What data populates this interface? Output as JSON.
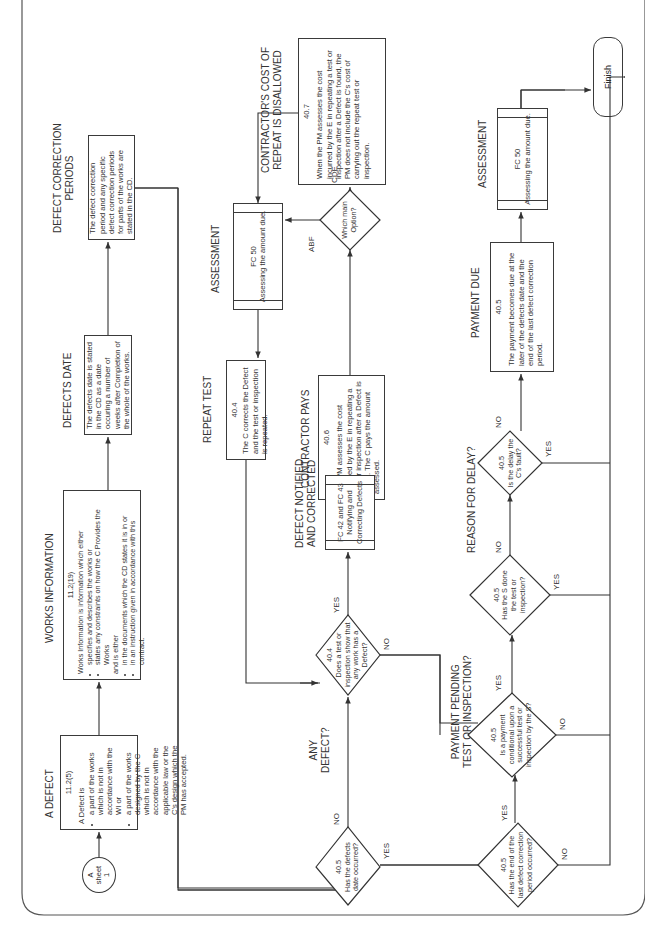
{
  "orientation": "rotated 90 degrees counterclockwise",
  "connector": {
    "label": "A",
    "sub": "sheet",
    "num": "1"
  },
  "headings": {
    "a_defect": "A DEFECT",
    "works_information": "WORKS INFORMATION",
    "defects_date": "DEFECTS DATE",
    "defect_correction_periods_1": "DEFECT CORRECTION",
    "defect_correction_periods_2": "PERIODS",
    "repeat_test": "REPEAT TEST",
    "assessment_1": "ASSESSMENT",
    "contractors_cost_1": "CONTRACTOR'S COST OF",
    "contractors_cost_2": "REPEAT IS DISALLOWED",
    "contractor_pays": "CONTRACTOR PAYS",
    "defect_notified_1": "DEFECT NOTIFIED",
    "defect_notified_2": "AND CORRECTED",
    "any_defect_1": "ANY",
    "any_defect_2": "DEFECT?",
    "payment_pending_1": "PAYMENT PENDING",
    "payment_pending_2": "TEST OR INSPECTION?",
    "reason_for_delay": "REASON FOR DELAY?",
    "payment_due": "PAYMENT DUE",
    "assessment_2": "ASSESSMENT"
  },
  "boxes": {
    "a_defect": {
      "ref": "11.2(5)",
      "intro": "A Defect is",
      "bullets": [
        "a part of the works which is not in accordance with the WI or",
        "a part of the works designed by the C which is not in accordance with the applicable law or the C's design which the PM has accepted."
      ]
    },
    "works_information": {
      "ref": "11.2(19)",
      "intro": "Works Information is information which either",
      "bullets1": [
        "specifies and describes the works or",
        "states any constraints on how the C Provides the Works"
      ],
      "mid": "and is either",
      "bullets2": [
        "in the documents which the CD states it is in or",
        "in an instruction given in accordance with this contract."
      ]
    },
    "defects_date": "The defects date is stated in the CD as a date occuring a number of weeks after Completion of the whole of the works.",
    "defect_correction_periods": "The defect correction period and any specific defect correction periods for parts of the works are stated in the CD.",
    "repeat_test": {
      "ref": "40.4",
      "text": "The C corrects the Defect and the test or inspection is repeated."
    },
    "contractors_cost": {
      "ref": "40.7",
      "text": "When the PM assesses the cost incurred by the E in repeating a test or inspection after a Defect is found, the PM does not include the C's cost of carrying out the repeat test or inspection."
    },
    "contractor_pays": {
      "ref": "40.6",
      "text": "The PM assesses the cost incurred by the E in repeating a test or inspection after a Defect is found. The C pays the amount assessed."
    },
    "payment_due": {
      "ref": "40.5",
      "text": "The payment becomes due at the later of the defects date and the end of the last defect correction period."
    }
  },
  "processes": {
    "fc50_a": {
      "code": "FC 50",
      "text": "Assessing the amount due."
    },
    "fc42_43": {
      "code": "FC 42 and FC 43",
      "text": "Notifying and Correcting Defects"
    },
    "fc50_b": {
      "code": "FC 50",
      "text": "Assessing the amount due."
    }
  },
  "decisions": {
    "main_option": {
      "ref": "",
      "text": "Which main Option?",
      "abf": "ABF",
      "cde": "CDE"
    },
    "defects_date_occurred": {
      "ref": "40.5",
      "text": "Has the defects date occurred?",
      "no": "NO",
      "yes": "YES"
    },
    "any_defect": {
      "ref": "40.4",
      "text": "Does a test or inspection show that any work has a Defect?",
      "yes": "YES",
      "no": "NO"
    },
    "last_correction_period": {
      "ref": "40.5",
      "text": "Has the end of the last defect correction period occurred?",
      "yes": "YES",
      "no": "NO"
    },
    "payment_conditional": {
      "ref": "40.5",
      "text": "Is a payment conditional upon a successful test or inspection by the S?",
      "yes": "YES",
      "no": "NO"
    },
    "supervisor_done": {
      "ref": "40.5",
      "text": "Has the S done the test or inspection?",
      "no": "NO",
      "yes": "YES"
    },
    "delay_fault": {
      "ref": "40.5",
      "text": "Is the delay the C's fault?",
      "no": "NO",
      "yes": "YES"
    }
  },
  "terminal": {
    "finish": "Finish"
  }
}
